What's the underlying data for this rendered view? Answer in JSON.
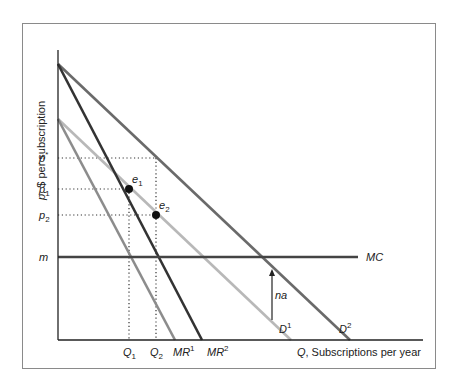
{
  "chart_data": {
    "type": "line",
    "title": "",
    "xlabel_var": "Q",
    "xlabel": ", Subscriptions per year",
    "ylabel_var": "p",
    "ylabel": ", $ per subscription",
    "xlim": [
      0,
      365
    ],
    "ylim": [
      0,
      290
    ],
    "series": [
      {
        "name": "D1",
        "label_main": "D",
        "label_sup": "1",
        "color": "#b8b8b8",
        "points": [
          [
            0,
            221
          ],
          [
            233,
            0
          ]
        ]
      },
      {
        "name": "MR1",
        "label_main": "MR",
        "label_sup": "1",
        "color": "#8c8c8c",
        "points": [
          [
            0,
            221
          ],
          [
            117,
            0
          ]
        ]
      },
      {
        "name": "D2",
        "label_main": "D",
        "label_sup": "2",
        "color": "#6a6a6a",
        "points": [
          [
            0,
            276
          ],
          [
            292,
            0
          ]
        ]
      },
      {
        "name": "MR2",
        "label_main": "MR",
        "label_sup": "2",
        "color": "#333333",
        "points": [
          [
            0,
            276
          ],
          [
            144,
            0
          ]
        ]
      },
      {
        "name": "MC",
        "label_main": "MC",
        "label_sup": "",
        "color": "#444444",
        "points": [
          [
            0,
            83
          ],
          [
            300,
            83
          ]
        ]
      }
    ],
    "y_ticks": [
      {
        "label_main": "p",
        "label_sup": "*",
        "label_sub": "",
        "value": 182
      },
      {
        "label_main": "p",
        "label_sup": "",
        "label_sub": "1",
        "value": 151
      },
      {
        "label_main": "p",
        "label_sup": "",
        "label_sub": "2",
        "value": 125
      },
      {
        "label_main": "m",
        "label_sup": "",
        "label_sub": "",
        "value": 83
      }
    ],
    "x_ticks": [
      {
        "label_main": "Q",
        "label_sub": "1",
        "value": 71
      },
      {
        "label_main": "Q",
        "label_sub": "2",
        "value": 98
      }
    ],
    "points": [
      {
        "name": "e1",
        "label_main": "e",
        "label_sub": "1",
        "q": 71,
        "p": 151
      },
      {
        "name": "e2",
        "label_main": "e",
        "label_sub": "2",
        "q": 98,
        "p": 125
      }
    ],
    "guides": [
      {
        "name": "p-star-guide",
        "from": [
          0,
          182
        ],
        "to": [
          98,
          182
        ],
        "down_to": [
          98,
          0
        ]
      },
      {
        "name": "p1-guide",
        "from": [
          0,
          151
        ],
        "to": [
          71,
          151
        ],
        "down_to": [
          71,
          0
        ]
      },
      {
        "name": "p2-guide",
        "from": [
          0,
          125
        ],
        "to": [
          98,
          125
        ]
      }
    ],
    "annotation": {
      "label": "na",
      "q": 214,
      "p_from": 20,
      "p_to": 70
    }
  }
}
